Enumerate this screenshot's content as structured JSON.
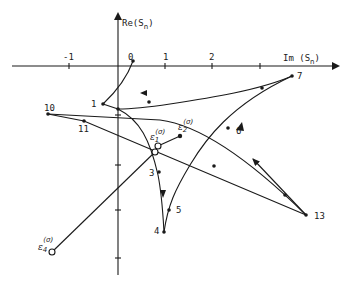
{
  "axes": {
    "x_label": "Im (S",
    "x_label_sub": "n",
    "x_label_close": ")",
    "y_label": "Re(S",
    "y_label_sub": "n",
    "y_label_close": ")",
    "x_ticks": [
      "-1",
      "0",
      "1",
      "2"
    ]
  },
  "points": {
    "p1": "1",
    "p3": "3",
    "p4": "4",
    "p5": "5",
    "p6": "6",
    "p7": "7",
    "p10": "10",
    "p11": "11",
    "p13": "13"
  },
  "epsilon": {
    "e1": "ε",
    "e1_sub": "1",
    "e1_sup": "(σ)",
    "e2": "ε",
    "e2_sub": "2",
    "e2_sup": "(σ)",
    "e4": "ε",
    "e4_sub": "4",
    "e4_sup": "(σ)"
  }
}
